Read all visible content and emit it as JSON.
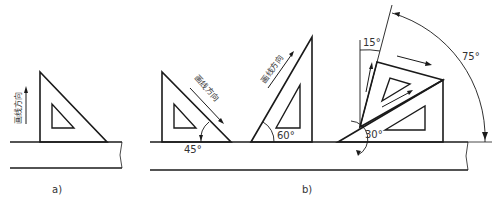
{
  "figure": {
    "panel_a": {
      "caption": "a)",
      "direction_label": "画线方向"
    },
    "panel_b": {
      "caption": "b)",
      "direction_label_1": "画线方向",
      "direction_label_2": "画线方向",
      "angles": {
        "a45": "45°",
        "a60": "60°",
        "a30": "30°",
        "a15": "15°",
        "a75": "75°"
      }
    },
    "colors": {
      "line": "#1a1a1a",
      "background": "#ffffff"
    }
  }
}
